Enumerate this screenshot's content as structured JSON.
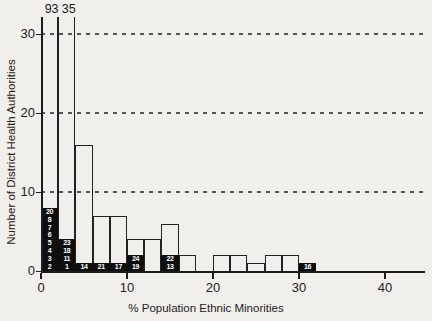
{
  "chart_data": {
    "type": "bar",
    "subtype": "histogram",
    "title": "",
    "xlabel": "% Population Ethnic Minorities",
    "ylabel": "Number of District Health Authorities",
    "x_ticks": [
      0,
      10,
      20,
      30,
      40
    ],
    "y_ticks": [
      0,
      10,
      20,
      30
    ],
    "y_axis_display_max": 32,
    "grid": "dashed horizontal at 10, 20, 30",
    "bin_width_percent": 2,
    "bins": [
      {
        "x0": 0,
        "x1": 2,
        "count": 93,
        "clipped": true,
        "overflow_label": "93",
        "black_segment_labels": [
          "20",
          "8",
          "7",
          "6",
          "5",
          "4",
          "3",
          "2"
        ]
      },
      {
        "x0": 2,
        "x1": 4,
        "count": 35,
        "clipped": true,
        "overflow_label": "35",
        "black_segment_labels": [
          "23",
          "18",
          "11",
          "1"
        ]
      },
      {
        "x0": 4,
        "x1": 6,
        "count": 16,
        "clipped": false,
        "black_segment_labels": [
          "14"
        ]
      },
      {
        "x0": 6,
        "x1": 8,
        "count": 7,
        "clipped": false,
        "black_segment_labels": [
          "21"
        ]
      },
      {
        "x0": 8,
        "x1": 10,
        "count": 7,
        "clipped": false,
        "black_segment_labels": [
          "17"
        ]
      },
      {
        "x0": 10,
        "x1": 12,
        "count": 4,
        "clipped": false,
        "black_segment_labels": [
          "24",
          "19"
        ]
      },
      {
        "x0": 12,
        "x1": 14,
        "count": 4,
        "clipped": false,
        "black_segment_labels": []
      },
      {
        "x0": 14,
        "x1": 16,
        "count": 6,
        "clipped": false,
        "black_segment_labels": [
          "22",
          "13"
        ]
      },
      {
        "x0": 16,
        "x1": 18,
        "count": 2,
        "clipped": false,
        "black_segment_labels": []
      },
      {
        "x0": 18,
        "x1": 20,
        "count": 0,
        "clipped": false,
        "black_segment_labels": []
      },
      {
        "x0": 20,
        "x1": 22,
        "count": 2,
        "clipped": false,
        "black_segment_labels": []
      },
      {
        "x0": 22,
        "x1": 24,
        "count": 2,
        "clipped": false,
        "black_segment_labels": []
      },
      {
        "x0": 24,
        "x1": 26,
        "count": 1,
        "clipped": false,
        "black_segment_labels": []
      },
      {
        "x0": 26,
        "x1": 28,
        "count": 2,
        "clipped": false,
        "black_segment_labels": []
      },
      {
        "x0": 28,
        "x1": 30,
        "count": 2,
        "clipped": false,
        "black_segment_labels": []
      },
      {
        "x0": 30,
        "x1": 32,
        "count": 1,
        "clipped": false,
        "black_segment_labels": [
          "16"
        ]
      }
    ],
    "colors": {
      "background": "#f1efeb",
      "axis_line": "#1c1c1c",
      "bar_outline": "#222222",
      "black_segment_fill": "#0e0e0e",
      "black_segment_text": "#ffffff",
      "gridline": "#555555"
    }
  }
}
